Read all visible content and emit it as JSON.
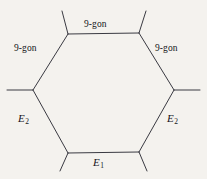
{
  "figure": {
    "type": "hexagonal-cell-diagram",
    "background_color": "#f4f2ee",
    "line_color": "#3a3a42",
    "line_width": 1,
    "text_color": "#15161a",
    "shape": {
      "name": "hexagon",
      "orientation": "pointy-left-right",
      "vertex_count": 6,
      "vertices": [
        {
          "id": "top-left",
          "x": 68,
          "y": 34
        },
        {
          "id": "top-right",
          "x": 139,
          "y": 33
        },
        {
          "id": "right",
          "x": 174,
          "y": 90
        },
        {
          "id": "bottom-right",
          "x": 139,
          "y": 152
        },
        {
          "id": "bottom-left",
          "x": 68,
          "y": 153
        },
        {
          "id": "left",
          "x": 33,
          "y": 90
        }
      ],
      "stubs": [
        {
          "from": "top-left",
          "to_x": 62,
          "to_y": 11
        },
        {
          "from": "top-right",
          "to_x": 146,
          "to_y": 11
        },
        {
          "from": "right",
          "to_x": 200,
          "to_y": 90
        },
        {
          "from": "bottom-right",
          "to_x": 147,
          "to_y": 171
        },
        {
          "from": "bottom-left",
          "to_x": 60,
          "to_y": 171
        },
        {
          "from": "left",
          "to_x": 7,
          "to_y": 90
        }
      ]
    },
    "edges": [
      {
        "id": "top",
        "label": "9-gon",
        "style": "plain"
      },
      {
        "id": "upper-left",
        "label": "9-gon",
        "style": "plain"
      },
      {
        "id": "upper-right",
        "label": "9-gon",
        "style": "plain"
      },
      {
        "id": "lower-left",
        "label": "E",
        "subscript": "2",
        "style": "math"
      },
      {
        "id": "lower-right",
        "label": "E",
        "subscript": "2",
        "style": "math"
      },
      {
        "id": "bottom",
        "label": "E",
        "subscript": "1",
        "style": "math"
      }
    ],
    "labels": {
      "top": "9-gon",
      "upper_left": "9-gon",
      "upper_right": "9-gon",
      "lower_left_base": "E",
      "lower_left_sub": "2",
      "lower_right_base": "E",
      "lower_right_sub": "2",
      "bottom_base": "E",
      "bottom_sub": "1"
    }
  }
}
